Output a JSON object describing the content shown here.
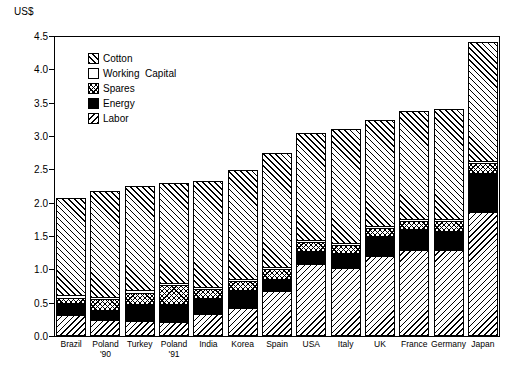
{
  "chart_data": {
    "type": "bar",
    "subtype": "stacked-vertical",
    "title": "",
    "xlabel": "",
    "ylabel": "US$",
    "ylim": [
      0.0,
      4.5
    ],
    "ytick_values": [
      0.0,
      0.5,
      1.0,
      1.5,
      2.0,
      2.5,
      3.0,
      3.5,
      4.0,
      4.5
    ],
    "ytick_labels": [
      "0.0",
      "0.5",
      "1.0",
      "1.5",
      "2.0",
      "2.5",
      "3.0",
      "3.5",
      "4.0",
      "4.5"
    ],
    "grid": false,
    "legend_position": "upper-left-inside",
    "stack_order_bottom_to_top": [
      "Labor",
      "Energy",
      "Spares",
      "Working Capital",
      "Cotton"
    ],
    "categories": [
      "Brazil",
      "Poland\n'90",
      "Turkey",
      "Poland\n'91",
      "India",
      "Korea",
      "Spain",
      "USA",
      "Italy",
      "UK",
      "France",
      "Germany",
      "Japan"
    ],
    "series": [
      {
        "name": "Labor",
        "pattern": "backward-diagonal",
        "values": [
          0.3,
          0.22,
          0.21,
          0.2,
          0.31,
          0.4,
          0.66,
          1.06,
          1.0,
          1.18,
          1.28,
          1.28,
          1.85
        ]
      },
      {
        "name": "Energy",
        "pattern": "solid-black",
        "values": [
          0.19,
          0.17,
          0.27,
          0.28,
          0.26,
          0.29,
          0.2,
          0.22,
          0.25,
          0.32,
          0.33,
          0.3,
          0.6
        ]
      },
      {
        "name": "Spares",
        "pattern": "crosshatch",
        "values": [
          0.08,
          0.16,
          0.17,
          0.28,
          0.14,
          0.13,
          0.15,
          0.13,
          0.12,
          0.12,
          0.11,
          0.15,
          0.15
        ]
      },
      {
        "name": "Working Capital",
        "pattern": "blank",
        "values": [
          0.04,
          0.03,
          0.04,
          0.03,
          0.03,
          0.03,
          0.03,
          0.03,
          0.03,
          0.03,
          0.03,
          0.03,
          0.03
        ]
      },
      {
        "name": "Cotton",
        "pattern": "forward-diagonal",
        "values": [
          1.46,
          1.59,
          1.56,
          1.5,
          1.58,
          1.64,
          1.7,
          1.6,
          1.7,
          1.59,
          1.62,
          1.64,
          1.78
        ]
      }
    ],
    "totals": [
      2.07,
      2.17,
      2.25,
      2.29,
      2.32,
      2.49,
      2.74,
      3.04,
      3.1,
      3.24,
      3.37,
      3.4,
      4.41
    ]
  },
  "legend": {
    "items": [
      {
        "label": "Cotton",
        "pattern": "forward-diagonal"
      },
      {
        "label": "Working  Capital",
        "pattern": "blank"
      },
      {
        "label": "Spares",
        "pattern": "crosshatch"
      },
      {
        "label": "Energy",
        "pattern": "solid-black"
      },
      {
        "label": "Labor",
        "pattern": "backward-diagonal"
      }
    ]
  }
}
